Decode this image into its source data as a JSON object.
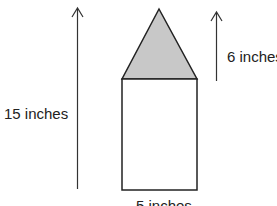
{
  "diagram": {
    "labels": {
      "total_height": "15 inches",
      "triangle_height": "6 inches",
      "base_width": "5 inches"
    },
    "shapes": {
      "triangle": {
        "fill": "#c8c8c8",
        "stroke": "#222222"
      },
      "rectangle": {
        "fill": "#ffffff",
        "stroke": "#222222"
      }
    }
  }
}
